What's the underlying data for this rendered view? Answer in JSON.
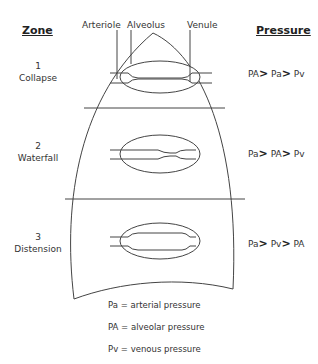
{
  "headers": {
    "zone": "Zone",
    "pressure": "Pressure"
  },
  "structure_labels": {
    "arteriole": "Arteriole",
    "alveolus": "Alveolus",
    "venule": "Venule"
  },
  "zones": [
    {
      "number": "1",
      "name": "Collapse",
      "p1": "PA",
      "p2": "Pa",
      "p3": "Pv",
      "gt": ">"
    },
    {
      "number": "2",
      "name": "Waterfall",
      "p1": "Pa",
      "p2": "PA",
      "p3": "Pv",
      "gt": ">"
    },
    {
      "number": "3",
      "name": "Distension",
      "p1": "Pa",
      "p2": "Pv",
      "p3": "PA",
      "gt": ">"
    }
  ],
  "legend": [
    {
      "symbol": "Pa",
      "text": "= arterial pressure"
    },
    {
      "symbol": "PA",
      "text": "= alveolar pressure"
    },
    {
      "symbol": "Pv",
      "text": "= venous pressure"
    }
  ],
  "colors": {
    "line": "#444444",
    "text": "#333333"
  }
}
